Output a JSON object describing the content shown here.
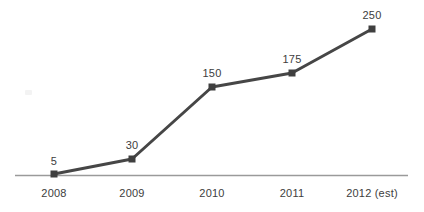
{
  "chart_data": {
    "type": "line",
    "title": "",
    "xlabel": "",
    "ylabel": "",
    "categories": [
      "2008",
      "2009",
      "2010",
      "2011",
      "2012 (est)"
    ],
    "values": [
      5,
      30,
      150,
      175,
      250
    ],
    "data_labels": [
      "5",
      "30",
      "150",
      "175",
      "250"
    ],
    "series": [
      {
        "name": "",
        "values": [
          5,
          30,
          150,
          175,
          250
        ]
      }
    ],
    "xlim": [
      0,
      4
    ],
    "ylim": [
      0,
      260
    ],
    "grid": false,
    "legend": false,
    "legend_position": "none",
    "marker": "square",
    "show_data_labels": true,
    "axis": {
      "x_axis_visible": true,
      "y_axis_visible": false,
      "x_axis_color": "#9a9a9a"
    }
  },
  "style": {
    "background": "#ffffff",
    "line_color": "#464646",
    "marker_color": "#3f3f3f",
    "text_color": "#3d3d3d",
    "axis_color": "#9a9a9a"
  },
  "geometry": {
    "points": [
      {
        "x": 54,
        "y": 174,
        "label_x": 54,
        "label_y": 167
      },
      {
        "x": 132,
        "y": 159,
        "label_x": 132,
        "label_y": 151
      },
      {
        "x": 212,
        "y": 87,
        "label_x": 212,
        "label_y": 79
      },
      {
        "x": 292,
        "y": 73,
        "label_x": 292,
        "label_y": 65
      },
      {
        "x": 372,
        "y": 29,
        "label_x": 372,
        "label_y": 21
      }
    ],
    "tick_positions": [
      54,
      132,
      212,
      292,
      372
    ],
    "tick_label_y": 187,
    "axis_y": 175,
    "axis_x_start": 15,
    "axis_x_end": 408
  }
}
